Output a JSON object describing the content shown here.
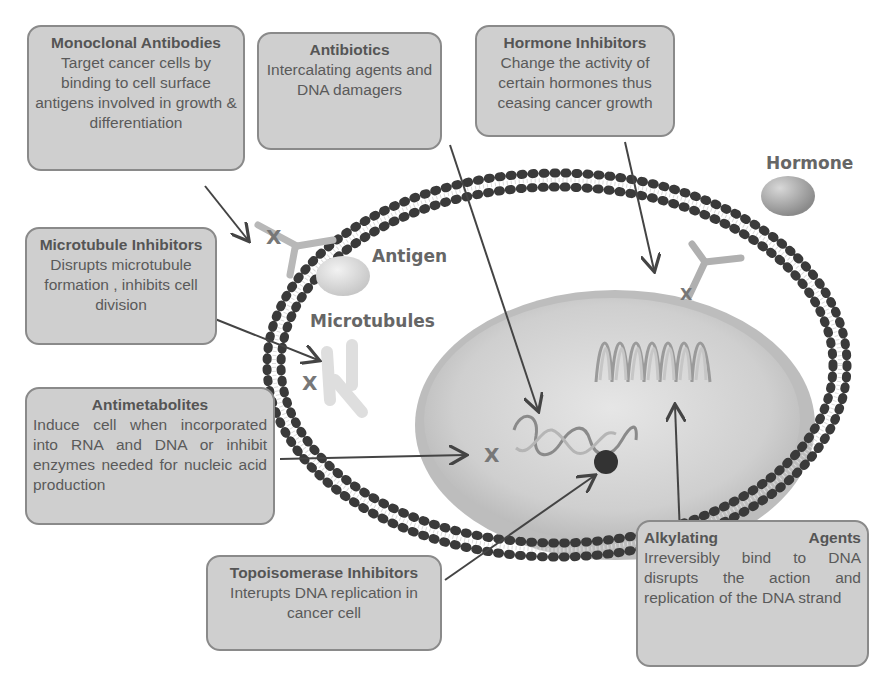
{
  "boxes": {
    "monoclonal": {
      "title": "Monoclonal Antibodies",
      "desc": "Target cancer cells by binding to cell surface antigens involved in growth & differentiation"
    },
    "antibiotics": {
      "title": "Antibiotics",
      "desc": "Intercalating agents and DNA damagers"
    },
    "hormone_inhibitors": {
      "title": "Hormone Inhibitors",
      "desc": "Change the activity of certain hormones thus ceasing cancer growth"
    },
    "microtubule_inhibitors": {
      "title": "Microtubule Inhibitors",
      "desc": "Disrupts microtubule formation , inhibits cell division"
    },
    "antimetabolites": {
      "title": "Antimetabolites",
      "desc": "Induce cell when incorporated into RNA and DNA or inhibit enzymes needed for nucleic acid production"
    },
    "topoisomerase": {
      "title": "Topoisomerase Inhibitors",
      "desc": "Interupts DNA replication in cancer cell"
    },
    "alkylating": {
      "title": "Alkylating Agents",
      "desc": "Irreversibly bind to DNA disrupts the action and replication of the DNA strand"
    }
  },
  "labels": {
    "hormone": "Hormone",
    "antigen": "Antigen",
    "microtubules": "Microtubules",
    "x_mark": "X"
  },
  "colors": {
    "box_fill": "#cfcfcf",
    "box_border": "#8a8a8a",
    "membrane_head": "#3a3a3a",
    "nucleus": "#c8c8c8",
    "arrow": "#444444"
  }
}
